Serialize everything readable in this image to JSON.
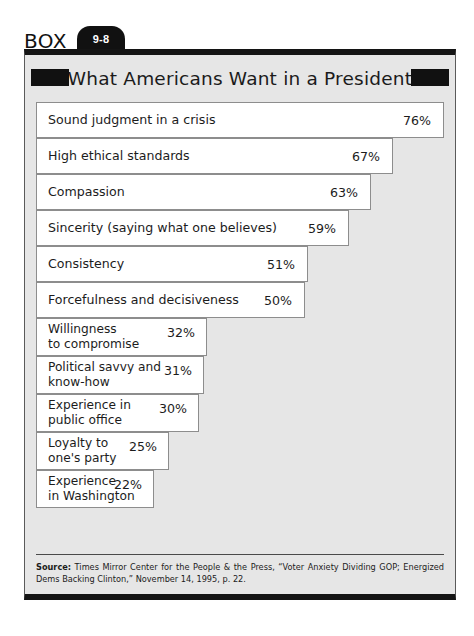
{
  "box": {
    "label": "BOX",
    "number": "9-8",
    "title": "What Americans Want in a President"
  },
  "source": {
    "prefix": "Source:",
    "text": " Times Mirror Center for the People & the Press, “Voter Anxiety Dividing GOP; Energized Dems Backing Clinton,” November 14, 1995, p. 22."
  },
  "colors": {
    "frame_black": "#141414",
    "panel_gray": "#e6e6e6",
    "bar_white": "#ffffff",
    "bar_border": "#8d8d8d",
    "text": "#1c1c1c"
  },
  "chart_data": {
    "type": "bar",
    "orientation": "horizontal",
    "title": "What Americans Want in a President",
    "xlabel": "",
    "ylabel": "",
    "xlim": [
      0,
      80
    ],
    "grid": false,
    "legend": null,
    "value_suffix": "%",
    "categories": [
      "Sound judgment in a crisis",
      "High ethical standards",
      "Compassion",
      "Sincerity (saying what one believes)",
      "Consistency",
      "Forcefulness and decisiveness",
      "Willingness to compromise",
      "Political savvy and know-how",
      "Experience in public office",
      "Loyalty to one's party",
      "Experience in Washington"
    ],
    "values": [
      76,
      67,
      63,
      59,
      51,
      50,
      32,
      31,
      30,
      25,
      22
    ],
    "labels": [
      "76%",
      "67%",
      "63%",
      "59%",
      "51%",
      "50%",
      "32%",
      "31%",
      "30%",
      "25%",
      "22%"
    ],
    "bars": [
      {
        "label": "Sound judgment in a crisis",
        "value": 76,
        "value_label": "76%",
        "lines": 1,
        "width_px": 408
      },
      {
        "label": "High ethical standards",
        "value": 67,
        "value_label": "67%",
        "lines": 1,
        "width_px": 357
      },
      {
        "label": "Compassion",
        "value": 63,
        "value_label": "63%",
        "lines": 1,
        "width_px": 335
      },
      {
        "label": "Sincerity (saying what one believes)",
        "value": 59,
        "value_label": "59%",
        "lines": 1,
        "width_px": 313
      },
      {
        "label": "Consistency",
        "value": 51,
        "value_label": "51%",
        "lines": 1,
        "width_px": 272
      },
      {
        "label": "Forcefulness and decisiveness",
        "value": 50,
        "value_label": "50%",
        "lines": 1,
        "width_px": 269
      },
      {
        "label": "Willingness\nto compromise",
        "value": 32,
        "value_label": "32%",
        "lines": 2,
        "width_px": 171
      },
      {
        "label": "Political savvy and\nknow-how",
        "value": 31,
        "value_label": "31%",
        "lines": 2,
        "width_px": 168
      },
      {
        "label": "Experience in\npublic office",
        "value": 30,
        "value_label": "30%",
        "lines": 2,
        "width_px": 163
      },
      {
        "label": "Loyalty to\none's party",
        "value": 25,
        "value_label": "25%",
        "lines": 2,
        "width_px": 133
      },
      {
        "label": "Experience\nin Washington",
        "value": 22,
        "value_label": "22%",
        "lines": 2,
        "width_px": 118
      }
    ]
  }
}
